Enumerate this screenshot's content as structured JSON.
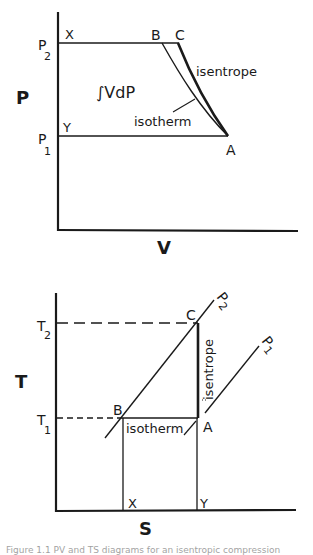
{
  "pv_diagram": {
    "y_axis_label": "P",
    "x_axis_label": "V",
    "p2_label": "P",
    "p2_sub": "2",
    "p1_label": "P",
    "p1_sub": "1",
    "point_x": "X",
    "point_y": "Y",
    "point_b": "B",
    "point_c": "C",
    "point_a": "A",
    "integral_label": "∫VdP",
    "isentrope_label": "isentrope",
    "isotherm_label": "isotherm"
  },
  "ts_diagram": {
    "y_axis_label": "T",
    "x_axis_label": "S",
    "t2_label": "T",
    "t2_sub": "2",
    "t1_label": "T",
    "t1_sub": "1",
    "point_c": "C",
    "point_b": "B",
    "point_a": "A",
    "point_x": "X",
    "point_y": "Y",
    "isobar_p2_label": "P",
    "isobar_p2_sub": "2",
    "isobar_p1_label": "P",
    "isobar_p1_sub": "1",
    "isentrope_label": "isentrope",
    "isotherm_label": "isotherm"
  },
  "caption": {
    "text": "Figure 1.1  PV and TS diagrams for an isentropic compression"
  }
}
